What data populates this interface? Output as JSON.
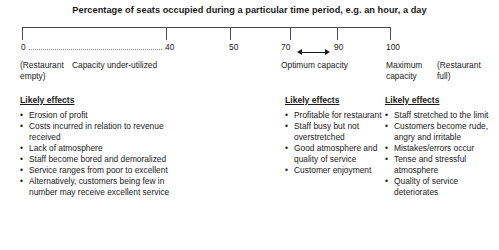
{
  "title": "Percentage of seats occupied during a particular time period, e.g. an hour, a day",
  "scale": {
    "ticks": [
      {
        "value": "0",
        "x": 22
      },
      {
        "value": "40",
        "x": 166
      },
      {
        "value": "50",
        "x": 230
      },
      {
        "value": "70",
        "x": 290
      },
      {
        "value": "90",
        "x": 337
      },
      {
        "value": "100",
        "x": 390
      }
    ],
    "annotations": {
      "under_utilized": "Capacity under-utilized",
      "restaurant_empty_line1": "(Restaurant",
      "restaurant_empty_line2": "empty)",
      "optimum": "Optimum capacity",
      "maximum_line1": "Maximum",
      "maximum_line2": "capacity",
      "restaurant_full_line1": "(Restaurant",
      "restaurant_full_line2": "full)"
    },
    "arrow_icon": "double-headed-arrow",
    "dotted_icon": "dotted-range-line"
  },
  "columns": [
    {
      "heading": "Likely effects",
      "bullet": "•",
      "items": [
        "Erosion of profit",
        "Costs incurred in relation to revenue received",
        "Lack of atmosphere",
        "Staff become bored and demoralized",
        "Service ranges from poor to excellent",
        "Alternatively, customers being few in number may receive excellent service"
      ]
    },
    {
      "heading": "Likely effects",
      "bullet": "•",
      "items": [
        "Profitable for restaurant",
        "Staff busy but not overstretched",
        "Good atmosphere and quality of service",
        "Customer enjoyment"
      ]
    },
    {
      "heading": "Likely effects",
      "bullet": "•",
      "items": [
        "Staff stretched to the limit",
        "Customers become rude, angry and irritable",
        "Mistakes/errors occur",
        "Tense and stressful atmosphere",
        "Quality of service deteriorates"
      ]
    }
  ],
  "chart_data": {
    "type": "line",
    "title": "Percentage of seats occupied during a particular time period, e.g. an hour, a day",
    "xlabel": "",
    "ylabel": "",
    "xlim": [
      0,
      100
    ],
    "grid": false,
    "legend": "none",
    "tick_values": [
      0,
      40,
      50,
      70,
      90,
      100
    ],
    "tick_labels": [
      "0",
      "40",
      "50",
      "70",
      "90",
      "100"
    ],
    "ranges": [
      {
        "from": 0,
        "to": 40,
        "label": "Capacity under-utilized",
        "style": "dotted"
      },
      {
        "from": 70,
        "to": 90,
        "label": "Optimum capacity",
        "style": "double-arrow"
      }
    ],
    "annotations": [
      {
        "at": 0,
        "text": "(Restaurant empty)"
      },
      {
        "at": 100,
        "text": "Maximum capacity"
      },
      {
        "at": 100,
        "text": "(Restaurant full)"
      }
    ]
  }
}
